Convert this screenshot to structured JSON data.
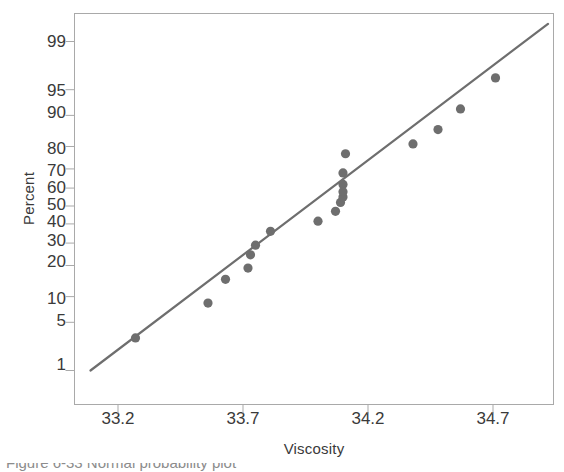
{
  "chart": {
    "type": "scatter",
    "title": "",
    "xlabel": "Viscosity",
    "ylabel": "Percent",
    "caption": "Figure 6-33  Normal probability plot",
    "point_color": "#6e6e6e",
    "line_color": "#6e6e6e",
    "frame_color": "#a9a9a9",
    "background": "#ffffff"
  },
  "chart_data": {
    "type": "scatter",
    "title": "",
    "xlabel": "Viscosity",
    "ylabel": "Percent",
    "xlim": [
      33.05,
      34.95
    ],
    "ylim": [
      0.6,
      99.8
    ],
    "yscale": "normal-probability",
    "grid": false,
    "legend": null,
    "xticks": [
      33.2,
      33.7,
      34.2,
      34.7
    ],
    "xticklabels": [
      "33.2",
      "33.7",
      "34.2",
      "34.7"
    ],
    "yticks": [
      1,
      5,
      10,
      20,
      30,
      40,
      50,
      60,
      70,
      80,
      90,
      95,
      99
    ],
    "yticklabels": [
      "1",
      "5",
      "10",
      "20",
      "30",
      "40",
      "50",
      "60",
      "70",
      "80",
      "90",
      "95",
      "99"
    ],
    "series": [
      {
        "name": "Viscosity sample",
        "marker": "filled-circle",
        "color": "#6e6e6e",
        "points": [
          {
            "x": 33.27,
            "y": 3.1
          },
          {
            "x": 33.56,
            "y": 8.5
          },
          {
            "x": 33.63,
            "y": 15.0
          },
          {
            "x": 33.72,
            "y": 19.0
          },
          {
            "x": 33.73,
            "y": 24.5
          },
          {
            "x": 33.75,
            "y": 29.0
          },
          {
            "x": 33.81,
            "y": 36.0
          },
          {
            "x": 34.0,
            "y": 41.5
          },
          {
            "x": 34.07,
            "y": 47.0
          },
          {
            "x": 34.09,
            "y": 52.0
          },
          {
            "x": 34.1,
            "y": 55.0
          },
          {
            "x": 34.1,
            "y": 58.0
          },
          {
            "x": 34.1,
            "y": 62.0
          },
          {
            "x": 34.1,
            "y": 68.0
          },
          {
            "x": 34.11,
            "y": 77.0
          },
          {
            "x": 34.38,
            "y": 81.0
          },
          {
            "x": 34.48,
            "y": 86.0
          },
          {
            "x": 34.57,
            "y": 91.5
          },
          {
            "x": 34.71,
            "y": 96.5
          }
        ]
      }
    ],
    "reference_line": {
      "name": "normal fit line",
      "color": "#6e6e6e",
      "x_start": 33.09,
      "y_start": 1.0,
      "x_end": 34.92,
      "y_end": 99.5
    }
  }
}
